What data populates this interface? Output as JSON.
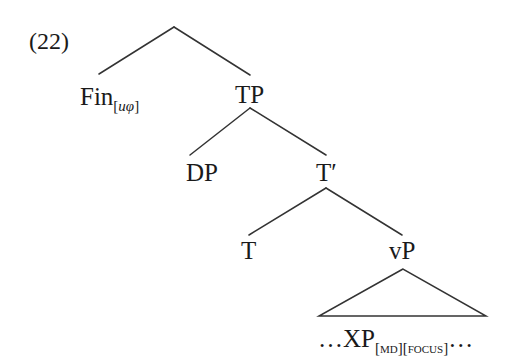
{
  "example_number": "(22)",
  "nodes": {
    "fin": {
      "label": "Fin",
      "subscript_open": "[",
      "subscript_italic": "uφ",
      "subscript_close": "]"
    },
    "tp": {
      "label": "TP"
    },
    "dp": {
      "label": "DP"
    },
    "tbar": {
      "label": "T′"
    },
    "t": {
      "label": "T"
    },
    "vp": {
      "label": "vP"
    },
    "xp": {
      "prefix": "…",
      "label": "XP",
      "feature1": "[MD]",
      "feature2": "[FOCUS]",
      "suffix": "…"
    }
  },
  "colors": {
    "line": "#333333",
    "text": "#1a1a1a"
  }
}
